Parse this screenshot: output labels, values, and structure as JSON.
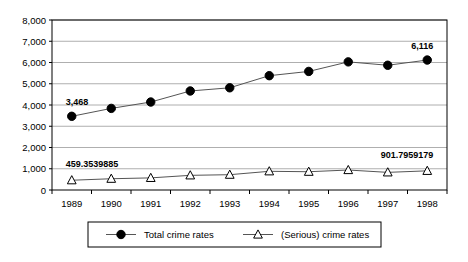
{
  "chart_data": {
    "type": "line",
    "title": "",
    "xlabel": "",
    "ylabel": "",
    "categories": [
      "1989",
      "1990",
      "1991",
      "1992",
      "1993",
      "1994",
      "1995",
      "1996",
      "1997",
      "1998"
    ],
    "ylim": [
      0,
      8000
    ],
    "yticks": [
      "0",
      "1,000",
      "2,000",
      "3,000",
      "4,000",
      "5,000",
      "6,000",
      "7,000",
      "8,000"
    ],
    "ytick_values": [
      0,
      1000,
      2000,
      3000,
      4000,
      5000,
      6000,
      7000,
      8000
    ],
    "grid": true,
    "legend_position": "bottom",
    "series": [
      {
        "name": "Total crime rates",
        "marker": "filled-circle",
        "values": [
          3468,
          3840,
          4140,
          4660,
          4810,
          5380,
          5580,
          6030,
          5870,
          6116
        ],
        "labels": [
          {
            "category": "1989",
            "text": "3,468"
          },
          {
            "category": "1998",
            "text": "6,116"
          }
        ]
      },
      {
        "name": "(Serious) crime rates",
        "marker": "open-triangle",
        "values": [
          459.3539885,
          530,
          570,
          690,
          720,
          880,
          860,
          940,
          830,
          901.7959179
        ],
        "labels": [
          {
            "category": "1989",
            "text": "459.3539885"
          },
          {
            "category": "1998",
            "text": "901.7959179"
          }
        ]
      }
    ]
  },
  "legend": {
    "entries": [
      {
        "label": "Total crime rates",
        "marker": "filled-circle"
      },
      {
        "label": "(Serious) crime rates",
        "marker": "open-triangle"
      }
    ]
  },
  "colors": {
    "line": "#555555",
    "grid": "#9a9a9a",
    "axis": "#000000",
    "marker_fill": "#000000",
    "marker_open": "#ffffff",
    "background": "#ffffff"
  }
}
